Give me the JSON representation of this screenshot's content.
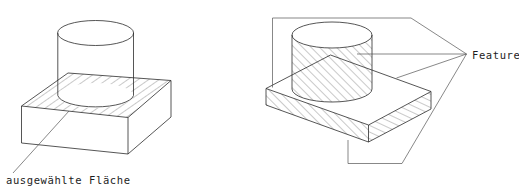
{
  "figure": {
    "title": "",
    "background_color": "#ffffff",
    "line_color": "#2b2b2b",
    "hatch_color": "#6f6f6f"
  },
  "left_figure": {
    "name": "selected-face-illustration",
    "label": "ausgewählte Fläche",
    "description": "cylinder on rectangular plate with hatched top face",
    "hatched_region": "plate-top-face",
    "leader_from": "plate-top-face",
    "leader_to": "label"
  },
  "right_figure": {
    "name": "feature-illustration",
    "label": "Feature",
    "description": "cylinder on rectangular plate with hatched cylinder body and hatched plate front and right faces",
    "hatched_regions": [
      "cylinder-body",
      "plate-front-face",
      "plate-right-face"
    ],
    "leader_count": 4,
    "leader_targets": [
      "plate-top-bracket",
      "cylinder-body",
      "plate-right-face",
      "plate-front-bracket"
    ]
  },
  "labels": {
    "selected_face": "ausgewählte Fläche",
    "feature": "Feature"
  }
}
